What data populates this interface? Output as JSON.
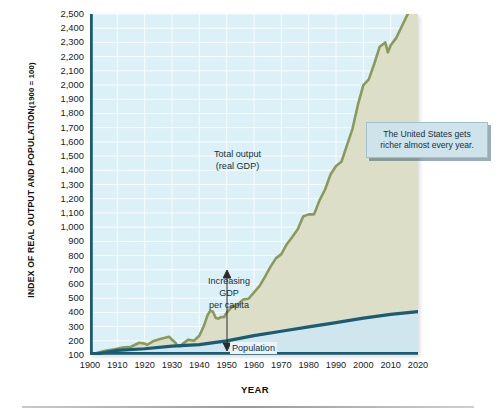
{
  "chart_data": {
    "type": "area",
    "title": "",
    "xlabel": "YEAR",
    "ylabel": "INDEX OF REAL OUTPUT AND POPULATION",
    "ylabel_note": "(1900 = 100)",
    "xlim": [
      1900,
      2020
    ],
    "ylim": [
      100,
      2500
    ],
    "grid": true,
    "legend_position": "inline-annotations",
    "ytick_labels": [
      "2,500",
      "2,400",
      "2,300",
      "2,200",
      "2,100",
      "2,000",
      "1,900",
      "1,800",
      "1,700",
      "1,600",
      "1,500",
      "1,400",
      "1,300",
      "1,200",
      "1,100",
      "1,000",
      "900",
      "800",
      "700",
      "600",
      "500",
      "400",
      "300",
      "200",
      "100"
    ],
    "ytick_values": [
      2500,
      2400,
      2300,
      2200,
      2100,
      2000,
      1900,
      1800,
      1700,
      1600,
      1500,
      1400,
      1300,
      1200,
      1100,
      1000,
      900,
      800,
      700,
      600,
      500,
      400,
      300,
      200,
      100
    ],
    "xtick_labels": [
      "1900",
      "1910",
      "1920",
      "1930",
      "1940",
      "1950",
      "1960",
      "1970",
      "1980",
      "1990",
      "2000",
      "2010",
      "2020"
    ],
    "xtick_values": [
      1900,
      1910,
      1920,
      1930,
      1940,
      1950,
      1960,
      1970,
      1980,
      1990,
      2000,
      2010,
      2020
    ],
    "colors": {
      "plot_background": "#dcf0f8",
      "gridline": "#ffffff",
      "gdp_line": "#8a9a5b",
      "gdp_fill": "#dcdcc4",
      "population_line": "#1c5c72",
      "population_fill": "#cfe6f2",
      "axis": "#1c5c72",
      "callout_background": "#cfe3ea"
    },
    "series": [
      {
        "name": "Total output (real GDP)",
        "color": "#8a9a5b",
        "x": [
          1900,
          1903,
          1906,
          1909,
          1912,
          1915,
          1918,
          1920,
          1921,
          1923,
          1926,
          1929,
          1930,
          1931,
          1932,
          1933,
          1934,
          1936,
          1938,
          1939,
          1940,
          1941,
          1942,
          1943,
          1944,
          1945,
          1946,
          1947,
          1948,
          1949,
          1950,
          1952,
          1954,
          1956,
          1958,
          1960,
          1962,
          1964,
          1966,
          1968,
          1970,
          1972,
          1974,
          1976,
          1978,
          1980,
          1982,
          1984,
          1986,
          1988,
          1990,
          1992,
          1994,
          1996,
          1998,
          2000,
          2002,
          2004,
          2006,
          2008,
          2009,
          2010,
          2012,
          2014,
          2016,
          2018,
          2019,
          2020
        ],
        "y": [
          100,
          118,
          132,
          140,
          152,
          158,
          186,
          180,
          172,
          196,
          214,
          228,
          208,
          192,
          166,
          162,
          180,
          208,
          200,
          218,
          236,
          276,
          322,
          380,
          412,
          405,
          360,
          356,
          368,
          366,
          398,
          440,
          452,
          490,
          496,
          540,
          585,
          650,
          720,
          780,
          810,
          880,
          930,
          985,
          1075,
          1090,
          1090,
          1190,
          1265,
          1370,
          1430,
          1460,
          1575,
          1690,
          1860,
          2000,
          2040,
          2150,
          2270,
          2300,
          2230,
          2280,
          2330,
          2410,
          2490,
          2570,
          2590,
          2540
        ]
      },
      {
        "name": "Population",
        "color": "#1c5c72",
        "x": [
          1900,
          1910,
          1920,
          1930,
          1940,
          1950,
          1960,
          1970,
          1980,
          1990,
          2000,
          2010,
          2020
        ],
        "y": [
          100,
          132,
          144,
          162,
          173,
          199,
          236,
          267,
          298,
          328,
          360,
          386,
          405
        ]
      }
    ],
    "annotations": [
      {
        "name": "total-output-label",
        "text_line1": "Total output",
        "text_line2": "(real GDP)"
      },
      {
        "name": "increasing-gdp-per-capita-label",
        "text_line1": "Increasing",
        "text_line2": "GDP",
        "text_line3": "per capita"
      },
      {
        "name": "population-label",
        "text": "Population"
      },
      {
        "name": "callout",
        "text": "The United States gets richer almost every year."
      }
    ]
  },
  "axes": {
    "y_title_main": "INDEX OF REAL OUTPUT AND POPULATION",
    "y_title_sub": "(1900 = 100)",
    "x_title": "YEAR"
  },
  "annotations": {
    "gdp_line1": "Total output",
    "gdp_line2": "(real GDP)",
    "capita_line1": "Increasing",
    "capita_line2": "GDP",
    "capita_line3": "per capita",
    "population": "Population",
    "callout": "The United States gets richer almost every year."
  }
}
